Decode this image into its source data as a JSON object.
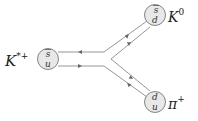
{
  "diagram": {
    "type": "quark-flow-decay",
    "colors": {
      "line": "#888888",
      "circle_fill": "#e6e6e6",
      "circle_stroke": "#777777",
      "text": "#222222"
    },
    "initial": {
      "label": "K",
      "sup": "*+",
      "quarks": {
        "top": "s",
        "bottom": "u",
        "top_bar": true
      }
    },
    "final_top": {
      "label": "K",
      "sup": "0",
      "quarks": {
        "top": "s",
        "bottom": "d",
        "top_bar": true
      }
    },
    "final_bottom": {
      "label": "π",
      "sup": "+",
      "quarks": {
        "top": "d",
        "bottom": "u",
        "top_bar": true
      }
    }
  }
}
